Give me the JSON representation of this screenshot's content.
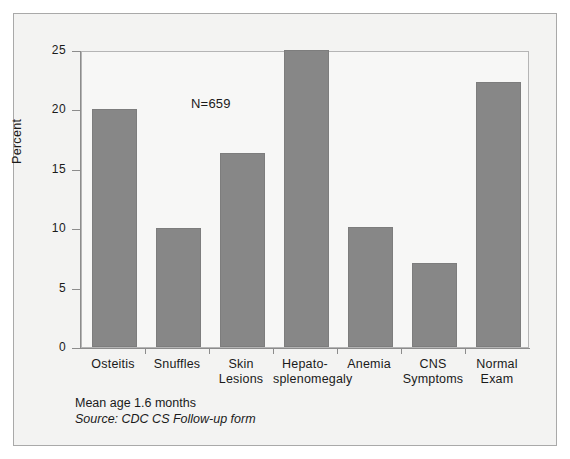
{
  "chart_data": {
    "type": "bar",
    "title": "",
    "xlabel": "",
    "ylabel": "Percent",
    "ylim": [
      0,
      25
    ],
    "yticks": [
      0,
      5,
      10,
      15,
      20,
      25
    ],
    "ytick_labels": [
      "0",
      "5",
      "10",
      "15",
      "20",
      "25"
    ],
    "grid": false,
    "legend": "none",
    "bar_color": "#878787",
    "categories": [
      "Osteitis",
      "Snuffles",
      "Skin Lesions",
      "Hepato-splenomegaly",
      "Anemia",
      "CNS Symptoms",
      "Normal Exam"
    ],
    "category_lines": [
      [
        "Osteitis"
      ],
      [
        "Snuffles"
      ],
      [
        "Skin",
        "Lesions"
      ],
      [
        "Hepato-",
        "splenomegaly"
      ],
      [
        "Anemia"
      ],
      [
        "CNS",
        "Symptoms"
      ],
      [
        "Normal",
        "Exam"
      ]
    ],
    "values": [
      20.0,
      10.0,
      16.3,
      25.0,
      10.1,
      7.1,
      22.3
    ],
    "annotations": [
      "N=659"
    ]
  },
  "annotation": {
    "sample_size": "N=659"
  },
  "axes": {
    "y_title": "Percent"
  },
  "footnotes": {
    "mean_age": "Mean age 1.6 months",
    "source": "Source: CDC CS Follow-up form"
  }
}
